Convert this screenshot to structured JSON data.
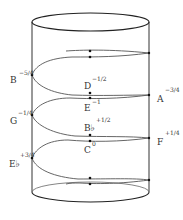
{
  "diagram": {
    "type": "helix-on-cylinder",
    "colors": {
      "stroke": "#333333",
      "curve": "#555555",
      "dot": "#111111",
      "text": "#333333"
    },
    "nodes": [
      {
        "id": "B",
        "name": "B",
        "exponent": "−5/4",
        "position": "left-wall"
      },
      {
        "id": "D",
        "name": "D",
        "exponent": "−1/2",
        "position": "front-center"
      },
      {
        "id": "A",
        "name": "A",
        "exponent": "−3/4",
        "position": "right-wall"
      },
      {
        "id": "E",
        "name": "E",
        "exponent": "−1",
        "position": "front-center"
      },
      {
        "id": "G",
        "name": "G",
        "exponent": "−1/4",
        "position": "left-wall"
      },
      {
        "id": "Bb",
        "name": "B♭",
        "exponent": "+1/2",
        "position": "front-center"
      },
      {
        "id": "C",
        "name": "C",
        "exponent": "0",
        "position": "front-center"
      },
      {
        "id": "F",
        "name": "F",
        "exponent": "+1/4",
        "position": "right-wall"
      },
      {
        "id": "Eb",
        "name": "E♭",
        "exponent": "+3/4",
        "position": "left-wall"
      }
    ]
  },
  "labels": {
    "B": {
      "name": "B",
      "exp": "−5/4"
    },
    "D": {
      "name": "D",
      "exp": "−1/2"
    },
    "A": {
      "name": "A",
      "exp": "−3/4"
    },
    "E": {
      "name": "E",
      "exp": "−1"
    },
    "G": {
      "name": "G",
      "exp": "−1/4"
    },
    "Bb": {
      "name": "B♭",
      "exp": "+1/2"
    },
    "C": {
      "name": "C",
      "exp": "0"
    },
    "F": {
      "name": "F",
      "exp": "+1/4"
    },
    "Eb": {
      "name": "E♭",
      "exp": "+3/4"
    }
  }
}
